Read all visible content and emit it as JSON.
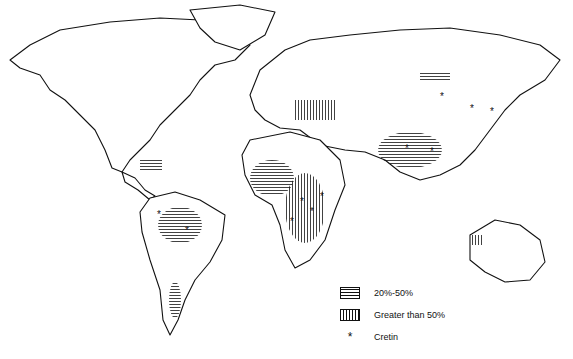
{
  "map": {
    "type": "world goiter prevalence map",
    "legend": [
      {
        "key": "moderate",
        "pattern": "horizontal-hatch",
        "label": "20%-50%"
      },
      {
        "key": "severe",
        "pattern": "vertical-hatch",
        "label": "Greater than 50%"
      },
      {
        "key": "cretin",
        "pattern": "asterisk",
        "symbol": "*",
        "label": "Cretin"
      }
    ],
    "colors": {
      "ink": "#111111",
      "background": "#ffffff"
    }
  }
}
